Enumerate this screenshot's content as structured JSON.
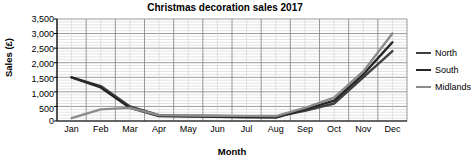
{
  "chart_data": {
    "type": "line",
    "title": "Christmas decoration sales 2017",
    "xlabel": "Month",
    "ylabel": "Sales (£)",
    "categories": [
      "Jan",
      "Feb",
      "Mar",
      "Apr",
      "May",
      "Jun",
      "Jul",
      "Aug",
      "Sep",
      "Oct",
      "Nov",
      "Dec"
    ],
    "ylim": [
      0,
      3500
    ],
    "ytick_values": [
      0,
      500,
      1000,
      1500,
      2000,
      2500,
      3000,
      3500
    ],
    "ytick_labels": [
      "0",
      "500",
      "1,000",
      "1,500",
      "2,000",
      "2,500",
      "3,000",
      "3,500"
    ],
    "grid": true,
    "minor_grid": true,
    "legend_position": "right",
    "series": [
      {
        "name": "North",
        "color": "#3f3f3f",
        "values": [
          1500,
          1200,
          500,
          200,
          180,
          170,
          160,
          150,
          350,
          600,
          1500,
          2400
        ]
      },
      {
        "name": "South",
        "color": "#262626",
        "values": [
          1500,
          1150,
          450,
          170,
          150,
          140,
          130,
          120,
          400,
          700,
          1600,
          2700
        ]
      },
      {
        "name": "Midlands",
        "color": "#8c8c8c",
        "values": [
          100,
          400,
          450,
          200,
          190,
          180,
          175,
          170,
          450,
          800,
          1700,
          3000
        ]
      }
    ]
  },
  "colors": {
    "axis": "#000000",
    "grid_major": "#808080",
    "grid_minor": "#d0d0d0",
    "plot_background": "#ffffff"
  }
}
